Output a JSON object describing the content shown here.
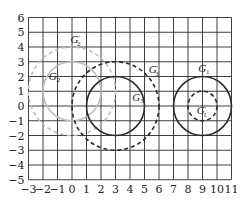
{
  "figure": {
    "type": "coordinate-grid-with-circles",
    "background": "#ffffff",
    "grid": {
      "x_min": -3,
      "x_max": 11,
      "y_min": -5,
      "y_max": 6,
      "color": "#2a2a2a",
      "x_ticks": [
        "-3",
        "-2",
        "-1",
        "0",
        "1",
        "2",
        "3",
        "4",
        "5",
        "6",
        "7",
        "8",
        "9",
        "10",
        "11"
      ],
      "y_ticks": [
        "6",
        "5",
        "4",
        "3",
        "2",
        "1",
        "0",
        "-1",
        "-2",
        "-3",
        "-4",
        "-5"
      ]
    },
    "colors": {
      "dark": "#2b2b2b",
      "light": "#bdbdbd"
    },
    "circles": [
      {
        "name": "G1",
        "cx": 9,
        "cy": 0,
        "r": 2,
        "style": "solid",
        "tone": "dark"
      },
      {
        "name": "G1'",
        "cx": 9,
        "cy": 0,
        "r": 1,
        "style": "dashed",
        "tone": "dark"
      },
      {
        "name": "G2",
        "cx": 0,
        "cy": 1,
        "r": 2,
        "style": "solid",
        "tone": "light"
      },
      {
        "name": "G2'",
        "cx": 0,
        "cy": 1,
        "r": 3,
        "style": "dashed",
        "tone": "light"
      },
      {
        "name": "G3",
        "cx": 3,
        "cy": 0,
        "r": 2,
        "style": "solid",
        "tone": "dark"
      },
      {
        "name": "G3'",
        "cx": 3,
        "cy": 0,
        "r": 3,
        "style": "dashed",
        "tone": "dark"
      }
    ],
    "labels": [
      {
        "text": "G",
        "sub": "1",
        "prime": false,
        "x": 8.7,
        "y": 2.3
      },
      {
        "text": "G",
        "sub": "1",
        "prime": true,
        "x": 8.6,
        "y": -0.55
      },
      {
        "text": "G",
        "sub": "2",
        "prime": false,
        "x": -1.6,
        "y": 1.75
      },
      {
        "text": "G",
        "sub": "2",
        "prime": true,
        "x": -0.1,
        "y": 4.3
      },
      {
        "text": "G",
        "sub": "3",
        "prime": false,
        "x": 4.15,
        "y": 0.35
      },
      {
        "text": "G",
        "sub": "3",
        "prime": true,
        "x": 5.3,
        "y": 2.25
      }
    ]
  }
}
